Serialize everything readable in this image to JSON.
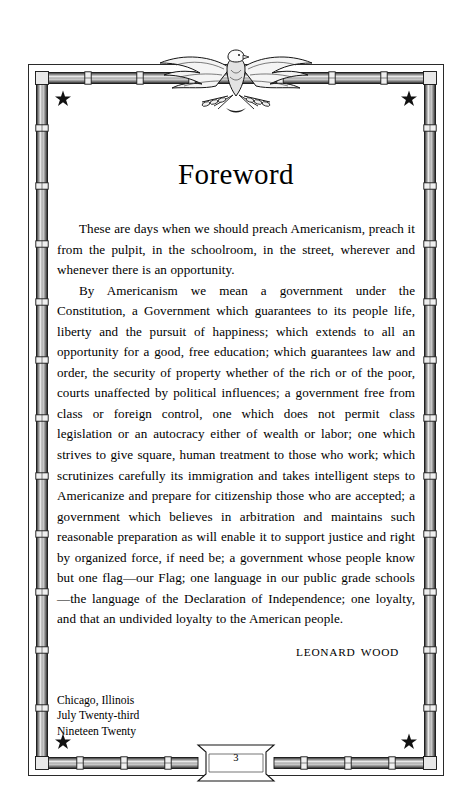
{
  "page": {
    "title": "Foreword",
    "page_number": "3",
    "paper_color": "#ffffff",
    "ink_color": "#000000"
  },
  "body": {
    "paragraphs": [
      "These are days when we should preach Americanism, preach it from the pulpit, in the schoolroom, in the street, wherever and whenever there is an opportunity.",
      "By Americanism we mean a government under the Constitution, a Government which guarantees to its people life, liberty and the pursuit of happiness; which extends to all an opportunity for a good, free education; which guarantees law and order, the security of property whether of the rich or of the poor, courts unaffected by political influences; a government free from class or foreign control, one which does not permit class legislation or an autocracy either of wealth or labor; one which strives to give square, human treatment to those who work; which scrutinizes carefully its immigration and takes intelligent steps to Americanize and prepare for citizenship those who are accepted; a government which believes in arbitration and maintains such reasonable preparation as will enable it to support justice and right by organized force, if need be; a government whose people know but one flag—our Flag; one language in our public grade schools—the language of the Declaration of Independence; one loyalty, and that an undivided loyalty to the American people."
    ]
  },
  "signature": {
    "name": "LEONARD WOOD"
  },
  "dateline": {
    "lines": [
      "Chicago, Illinois",
      "July Twenty-third",
      "Nineteen Twenty"
    ]
  },
  "ornament": {
    "top_center": "eagle-emblem",
    "corner_marks": "five-pointed-star",
    "rail_style": "bamboo-rail",
    "corner_star_count": 4
  }
}
